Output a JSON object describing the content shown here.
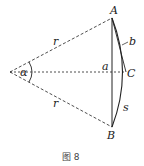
{
  "figure": {
    "caption": "图 8",
    "points": {
      "origin": {
        "x": 10,
        "y": 72
      },
      "A": {
        "label": "A",
        "x": 112,
        "y": 18
      },
      "B": {
        "label": "B",
        "x": 112,
        "y": 127
      },
      "C": {
        "label": "C",
        "x": 126,
        "y": 72
      }
    },
    "labels": {
      "radius_upper": "r",
      "radius_lower": "r",
      "angle": "α",
      "chord_half_segment": "a",
      "chord_b": "b",
      "arc": "s"
    },
    "colors": {
      "stroke": "#222222",
      "background": "#ffffff"
    }
  }
}
